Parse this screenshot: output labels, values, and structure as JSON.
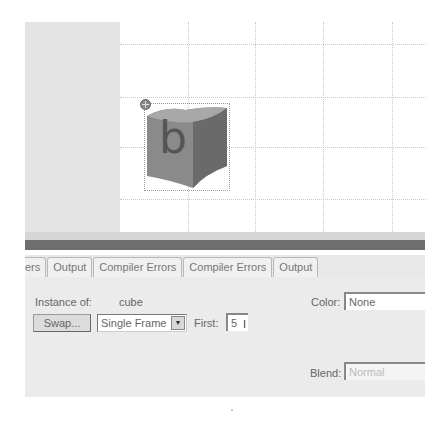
{
  "stage": {
    "symbol_letter": "b",
    "grid": {
      "vertical_x": [
        68,
        135,
        203,
        272
      ],
      "horizontal_y": [
        22,
        75,
        125,
        177
      ]
    }
  },
  "panel_tabs": [
    {
      "label": "ers"
    },
    {
      "label": "Output"
    },
    {
      "label": "Compiler Errors"
    },
    {
      "label": "Compiler Errors"
    },
    {
      "label": "Output"
    }
  ],
  "properties": {
    "instance_of_label": "Instance of:",
    "instance_of_value": "cube",
    "swap_button": "Swap...",
    "loop_select": {
      "value": "Single Frame",
      "arrow": "▼"
    },
    "first_label": "First:",
    "first_value": "5",
    "color_label": "Color:",
    "color_value": "None",
    "blend_label": "Blend:",
    "blend_value": "Normal"
  }
}
